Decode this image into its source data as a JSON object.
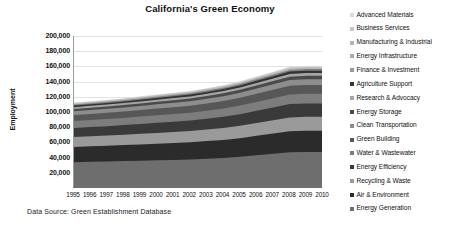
{
  "chart_data": {
    "type": "area",
    "title": "California's Green Economy",
    "xlabel": "",
    "ylabel": "Employment",
    "ylim": [
      0,
      200000
    ],
    "ytick_labels": [
      "20,000",
      "40,000",
      "60,000",
      "80,000",
      "100,000",
      "120,000",
      "140,000",
      "160,000",
      "180,000",
      "200,000"
    ],
    "ytick_values": [
      20000,
      40000,
      60000,
      80000,
      100000,
      120000,
      140000,
      160000,
      180000,
      200000
    ],
    "grid": true,
    "stacked": true,
    "legend_position": "right",
    "source_note": "Data Source: Green Establishment Database",
    "categories": [
      1995,
      1996,
      1997,
      1998,
      1999,
      2000,
      2001,
      2002,
      2003,
      2004,
      2005,
      2006,
      2007,
      2008,
      2009,
      2010
    ],
    "xtick_labels": [
      "1995",
      "1996",
      "1997",
      "1998",
      "1999",
      "2000",
      "2001",
      "2002",
      "2003",
      "2004",
      "2005",
      "2006",
      "2007",
      "2008",
      "2009",
      "2010"
    ],
    "series": [
      {
        "name": "Energy Generation",
        "color": "#6e6e6e",
        "values": [
          34000,
          34500,
          35000,
          35500,
          36000,
          36500,
          37000,
          37500,
          38500,
          39500,
          41000,
          43000,
          45000,
          47000,
          47500,
          47500
        ]
      },
      {
        "name": "Air & Environment",
        "color": "#2b2b2b",
        "values": [
          20000,
          20300,
          20600,
          21000,
          21400,
          21800,
          22200,
          22600,
          23200,
          23800,
          24600,
          25600,
          26600,
          27600,
          27800,
          27800
        ]
      },
      {
        "name": "Recycling & Waste",
        "color": "#9a9a9a",
        "values": [
          13000,
          13200,
          13400,
          13600,
          13900,
          14200,
          14500,
          14800,
          15200,
          15700,
          16200,
          16900,
          17600,
          18300,
          18400,
          18400
        ]
      },
      {
        "name": "Energy Efficiency",
        "color": "#3a3a3a",
        "values": [
          12000,
          12200,
          12400,
          12700,
          13000,
          13300,
          13600,
          13900,
          14300,
          14800,
          15400,
          16100,
          16800,
          17500,
          17600,
          17600
        ]
      },
      {
        "name": "Water & Wastewater",
        "color": "#7d7d7d",
        "values": [
          9000,
          9150,
          9300,
          9450,
          9650,
          9850,
          10050,
          10250,
          10550,
          10850,
          11250,
          11700,
          12150,
          12600,
          12700,
          12700
        ]
      },
      {
        "name": "Green Building",
        "color": "#575757",
        "values": [
          8000,
          8150,
          8300,
          8450,
          8650,
          8850,
          9050,
          9250,
          9550,
          9850,
          10250,
          10700,
          11150,
          11600,
          11650,
          11650
        ]
      },
      {
        "name": "Clean Transportation",
        "color": "#8d8d8d",
        "values": [
          5000,
          5100,
          5200,
          5300,
          5450,
          5600,
          5750,
          5900,
          6100,
          6300,
          6550,
          6850,
          7150,
          7450,
          7500,
          7500
        ]
      },
      {
        "name": "Energy Storage",
        "color": "#4a4a4a",
        "values": [
          3000,
          3060,
          3120,
          3190,
          3270,
          3350,
          3430,
          3510,
          3630,
          3750,
          3900,
          4080,
          4260,
          4440,
          4470,
          4470
        ]
      },
      {
        "name": "Research & Advocacy",
        "color": "#a5a5a5",
        "values": [
          2400,
          2450,
          2500,
          2560,
          2630,
          2700,
          2770,
          2840,
          2940,
          3040,
          3170,
          3320,
          3470,
          3620,
          3650,
          3650
        ]
      },
      {
        "name": "Agriculture Support",
        "color": "#333333",
        "values": [
          2000,
          2040,
          2080,
          2130,
          2190,
          2250,
          2310,
          2370,
          2450,
          2530,
          2640,
          2770,
          2900,
          3030,
          3050,
          3050
        ]
      },
      {
        "name": "Finance & Investment",
        "color": "#808080",
        "values": [
          1400,
          1430,
          1460,
          1495,
          1540,
          1585,
          1630,
          1675,
          1735,
          1795,
          1875,
          1970,
          2065,
          2160,
          2175,
          2175
        ]
      },
      {
        "name": "Energy Infrastructure",
        "color": "#b5b5b5",
        "values": [
          1100,
          1125,
          1150,
          1180,
          1215,
          1250,
          1285,
          1320,
          1370,
          1420,
          1485,
          1560,
          1635,
          1710,
          1725,
          1725
        ]
      },
      {
        "name": "Business Services",
        "color": "#c6c6c6",
        "values": [
          900,
          920,
          940,
          965,
          995,
          1025,
          1055,
          1085,
          1125,
          1165,
          1220,
          1285,
          1350,
          1415,
          1425,
          1425
        ]
      },
      {
        "name": "Advanced Materials",
        "color": "#dadada",
        "values": [
          600,
          615,
          630,
          650,
          670,
          690,
          710,
          730,
          760,
          790,
          830,
          875,
          920,
          965,
          975,
          975
        ]
      }
    ],
    "legend_entries": [
      {
        "label": "Advanced Materials",
        "color": "#dadada"
      },
      {
        "label": "Business Services",
        "color": "#c6c6c6"
      },
      {
        "label": "Manufacturing & Industrial",
        "color": "#b5b5b5"
      },
      {
        "label": "Energy Infrastructure",
        "color": "#a9a9a9"
      },
      {
        "label": "Finance & Investment",
        "color": "#9a9a9a"
      },
      {
        "label": "Agriculture Support",
        "color": "#333333"
      },
      {
        "label": "Research & Advocacy",
        "color": "#a5a5a5"
      },
      {
        "label": "Energy Storage",
        "color": "#4a4a4a"
      },
      {
        "label": "Clean Transportation",
        "color": "#8d8d8d"
      },
      {
        "label": "Green Building",
        "color": "#575757"
      },
      {
        "label": "Water & Wastewater",
        "color": "#7d7d7d"
      },
      {
        "label": "Energy Efficiency",
        "color": "#3a3a3a"
      },
      {
        "label": "Recycling & Waste",
        "color": "#9a9a9a"
      },
      {
        "label": "Air & Environment",
        "color": "#2b2b2b"
      },
      {
        "label": "Energy Generation",
        "color": "#6e6e6e"
      }
    ]
  }
}
